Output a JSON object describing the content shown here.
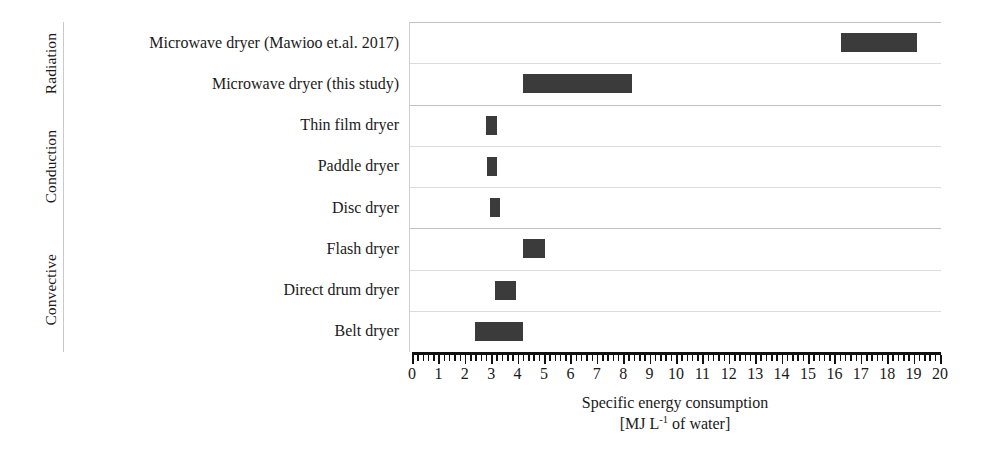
{
  "chart_data": {
    "type": "bar",
    "orientation": "horizontal",
    "subtype": "range-bar",
    "title": "",
    "xlabel": "Specific energy consumption [MJ L-1 of water]",
    "ylabel": "",
    "xlim": [
      0,
      20
    ],
    "xtick_step": 1,
    "minor_ticks_per_major": 5,
    "grid": true,
    "legend": false,
    "bar_color": "#3b3b3b",
    "categories": [
      "Microwave dryer (Mawioo et.al. 2017)",
      "Microwave dryer (this study)",
      "Thin film dryer",
      "Paddle dryer",
      "Disc dryer",
      "Flash dryer",
      "Direct drum dryer",
      "Belt dryer"
    ],
    "ranges": [
      [
        16.2,
        19.1
      ],
      [
        4.15,
        8.3
      ],
      [
        2.75,
        3.2
      ],
      [
        2.8,
        3.2
      ],
      [
        2.9,
        3.3
      ],
      [
        4.15,
        5.0
      ],
      [
        3.1,
        3.9
      ],
      [
        2.35,
        4.15
      ]
    ],
    "groups": [
      {
        "name": "Radiation",
        "rows": 2
      },
      {
        "name": "Conduction",
        "rows": 3
      },
      {
        "name": "Convective",
        "rows": 3
      }
    ]
  },
  "axis": {
    "tick_labels": [
      "0",
      "1",
      "2",
      "3",
      "4",
      "5",
      "6",
      "7",
      "8",
      "9",
      "10",
      "11",
      "12",
      "13",
      "14",
      "15",
      "16",
      "17",
      "18",
      "19",
      "20"
    ],
    "title_line1": "Specific energy consumption",
    "title_line2_prefix": "[MJ L",
    "title_line2_sup": "-1",
    "title_line2_suffix": " of water]"
  },
  "rows": [
    {
      "label": "Microwave dryer (Mawioo et.al. 2017)",
      "start": 16.2,
      "end": 19.1,
      "group": "Radiation"
    },
    {
      "label": "Microwave dryer (this study)",
      "start": 4.15,
      "end": 8.3,
      "group": "Radiation"
    },
    {
      "label": "Thin film dryer",
      "start": 2.75,
      "end": 3.2,
      "group": "Conduction"
    },
    {
      "label": "Paddle dryer",
      "start": 2.8,
      "end": 3.2,
      "group": "Conduction"
    },
    {
      "label": "Disc dryer",
      "start": 2.9,
      "end": 3.3,
      "group": "Conduction"
    },
    {
      "label": "Flash dryer",
      "start": 4.15,
      "end": 5.0,
      "group": "Convective"
    },
    {
      "label": "Direct drum dryer",
      "start": 3.1,
      "end": 3.9,
      "group": "Convective"
    },
    {
      "label": "Belt dryer",
      "start": 2.35,
      "end": 4.15,
      "group": "Convective"
    }
  ],
  "groups": [
    {
      "name": "Radiation",
      "rows": 2
    },
    {
      "name": "Conduction",
      "rows": 3
    },
    {
      "name": "Convective",
      "rows": 3
    }
  ]
}
